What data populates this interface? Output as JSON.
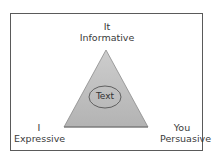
{
  "diagram": {
    "type": "rhetorical-triangle",
    "vertices": {
      "top": {
        "pronoun": "It",
        "function": "Informative"
      },
      "left": {
        "pronoun": "I",
        "function": "Expressive"
      },
      "right": {
        "pronoun": "You",
        "function": "Persuasive"
      }
    },
    "center_label": "Text",
    "colors": {
      "frame_border": "#5a5a5a",
      "triangle_fill_top": "#c9c9c9",
      "triangle_fill_bottom": "#b5b5b5",
      "triangle_stroke": "#7a7a7a",
      "ellipse_stroke": "#555555",
      "text": "#3a3a3a"
    }
  }
}
